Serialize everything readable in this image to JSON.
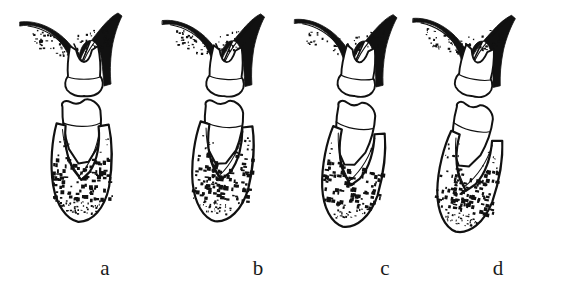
{
  "figure": {
    "kind": "anatomical-line-drawing",
    "background_color": "#FFFFFF",
    "ink_color": "#111111",
    "stipple_color": "#111111",
    "label_color": "#1A1A1A",
    "panel_count": 4,
    "labels": [
      {
        "id": "a",
        "text": "a",
        "x": 105,
        "y": 258
      },
      {
        "id": "b",
        "text": "b",
        "x": 258,
        "y": 258
      },
      {
        "id": "c",
        "text": "c",
        "x": 385,
        "y": 258
      },
      {
        "id": "d",
        "text": "d",
        "x": 498,
        "y": 258
      }
    ],
    "panels": [
      {
        "id": "a",
        "label": "a",
        "origin_x": 18,
        "crown_tilt_deg": 0,
        "root_tilt_deg": 2,
        "gap_between_teeth": 3,
        "bone_crest_height": "high",
        "stipple_density": "dense",
        "notes": "upper tooth seated in V-shaped interdental bone, lower tooth root fully enclosed by dense trabecular bone"
      },
      {
        "id": "b",
        "label": "b",
        "origin_x": 160,
        "crown_tilt_deg": 4,
        "root_tilt_deg": 8,
        "gap_between_teeth": 5,
        "bone_crest_height": "high",
        "stipple_density": "dense",
        "notes": "lower tooth tipped slightly distally, interdental space widened"
      },
      {
        "id": "c",
        "label": "c",
        "origin_x": 292,
        "crown_tilt_deg": 7,
        "root_tilt_deg": 12,
        "gap_between_teeth": 8,
        "bone_crest_height": "medium",
        "stipple_density": "medium",
        "notes": "greater separation of the two teeth, bone crest flattened"
      },
      {
        "id": "d",
        "label": "d",
        "origin_x": 410,
        "crown_tilt_deg": 10,
        "root_tilt_deg": 16,
        "gap_between_teeth": 12,
        "bone_crest_height": "low",
        "stipple_density": "dense",
        "notes": "maximum separation and tipping, widest interdental gap"
      }
    ]
  }
}
